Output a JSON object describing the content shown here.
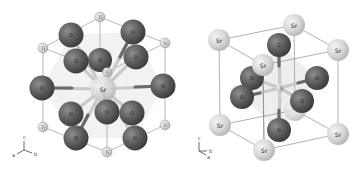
{
  "figure": {
    "panels": [
      {
        "id": "left",
        "description": "SrO12 cuboctahedron centered on Sr with Ti at cube corners",
        "center_atom": {
          "label": "Sr",
          "x": 103,
          "y": 89
        },
        "inner_ti_label": {
          "label": "Ti",
          "x": 107,
          "y": 72
        },
        "ti_atoms": [
          {
            "label": "Ti",
            "x": 100,
            "y": 17
          },
          {
            "label": "Ti",
            "x": 165,
            "y": 43
          },
          {
            "label": "Ti",
            "x": 43,
            "y": 48
          },
          {
            "label": "Ti",
            "x": 165,
            "y": 125
          },
          {
            "label": "Ti",
            "x": 43,
            "y": 127
          },
          {
            "label": "Ti",
            "x": 107,
            "y": 152
          }
        ],
        "o_atoms": [
          {
            "label": "O",
            "x": 71,
            "y": 35
          },
          {
            "label": "O",
            "x": 133,
            "y": 32
          },
          {
            "label": "O",
            "x": 76,
            "y": 61
          },
          {
            "label": "O",
            "x": 100,
            "y": 60
          },
          {
            "label": "O",
            "x": 136,
            "y": 57
          },
          {
            "label": "O",
            "x": 42,
            "y": 88
          },
          {
            "label": "O",
            "x": 163,
            "y": 86
          },
          {
            "label": "O",
            "x": 71,
            "y": 114
          },
          {
            "label": "O",
            "x": 107,
            "y": 112
          },
          {
            "label": "O",
            "x": 132,
            "y": 113
          },
          {
            "label": "O",
            "x": 76,
            "y": 138
          },
          {
            "label": "O",
            "x": 135,
            "y": 138
          }
        ],
        "axes": {
          "origin_x": 24,
          "origin_y": 150,
          "labels": {
            "c": "c",
            "a": "a",
            "b": "b"
          }
        }
      },
      {
        "id": "right",
        "description": "Perovskite SrTiO3 unit cell with Sr at corners and TiO6 octahedron",
        "center_atom": {
          "label": "Ti",
          "x": 280,
          "y": 88
        },
        "sr_atoms": [
          {
            "label": "Sr",
            "x": 219,
            "y": 40
          },
          {
            "label": "Sr",
            "x": 294,
            "y": 25
          },
          {
            "label": "Sr",
            "x": 338,
            "y": 50
          },
          {
            "label": "Sr",
            "x": 263,
            "y": 65
          },
          {
            "label": "Sr",
            "x": 220,
            "y": 125
          },
          {
            "label": "Sr",
            "x": 338,
            "y": 134
          },
          {
            "label": "Sr",
            "x": 264,
            "y": 150
          }
        ],
        "o_atoms": [
          {
            "label": "O",
            "x": 279,
            "y": 45
          },
          {
            "label": "O",
            "x": 252,
            "y": 78
          },
          {
            "label": "O",
            "x": 317,
            "y": 78
          },
          {
            "label": "O",
            "x": 242,
            "y": 97
          },
          {
            "label": "O",
            "x": 302,
            "y": 101
          },
          {
            "label": "O",
            "x": 279,
            "y": 130
          }
        ],
        "axes": {
          "origin_x": 200,
          "origin_y": 150,
          "labels": {
            "c": "c",
            "a": "a",
            "b": "b"
          }
        }
      }
    ],
    "colors": {
      "oxygen": "#5a5a5a",
      "oxygen_highlight": "#9a9a9a",
      "strontium": "#d8d8d8",
      "titanium": "#d4d4d4",
      "bond_light": "#c8c8c8",
      "bond_dark": "#6a6a6a",
      "polyhedron": "#e9e9e9",
      "cell_edge": "#8a8a8a"
    }
  }
}
